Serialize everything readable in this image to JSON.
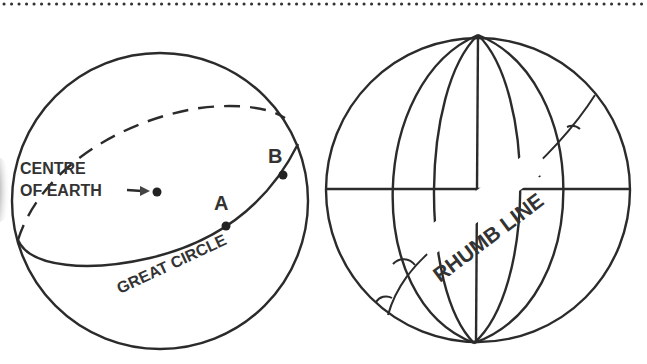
{
  "left_diagram": {
    "centre_label_line1": "CENTRE",
    "centre_label_line2": "OF EARTH",
    "point_a": "A",
    "point_b": "B",
    "great_circle_label": "GREAT CIRCLE"
  },
  "right_diagram": {
    "rhumb_line_label": "RHUMB LINE"
  },
  "colors": {
    "stroke": "#2b2b2b",
    "text": "#333333",
    "background": "#ffffff"
  }
}
